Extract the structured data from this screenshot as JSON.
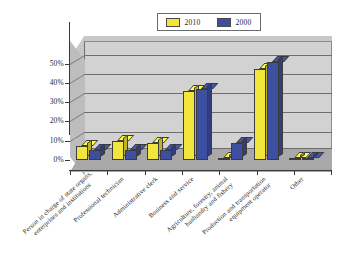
{
  "chart_data": {
    "type": "bar",
    "title": "",
    "subtitle": "",
    "xlabel": "",
    "ylabel": "",
    "ylim": [
      0,
      55
    ],
    "grid": true,
    "legend_position": "top-center",
    "style": "3d-clustered-column",
    "y_ticks": [
      "0%",
      "10%",
      "20%",
      "30%",
      "40%",
      "50%"
    ],
    "y_tick_values": [
      0,
      10,
      20,
      30,
      40,
      50
    ],
    "categories": [
      "Person in charge of state organs,\nenterprises and institutions",
      "Professional technician",
      "Administrative clerk",
      "Business and service",
      "Agriculture, forestry, animal\nhusbandry and fishery",
      "Production and transportation\nequipment operator",
      "Other"
    ],
    "series": [
      {
        "name": "2010",
        "color": "#F2E53C",
        "values": [
          7,
          10,
          9,
          36,
          1,
          47,
          1
        ]
      },
      {
        "name": "2000",
        "color": "#3D4F9E",
        "values": [
          5,
          5,
          5,
          37,
          9,
          51,
          1
        ]
      }
    ]
  },
  "legend": {
    "entries": [
      {
        "label": "2010",
        "color": "#F2E53C"
      },
      {
        "label": "2000",
        "color": "#3D4F9E"
      }
    ]
  },
  "axis": {
    "y_labels": [
      "50%",
      "40%",
      "30%",
      "20%",
      "10%",
      "0%"
    ]
  },
  "colors": {
    "series_2010": "#F2E53C",
    "series_2000": "#3D4F9E",
    "plot_background": "#D2D2D2",
    "floor": "#A8A8A8",
    "gridline": "#6F6F6F",
    "axis": "#3A3A3A",
    "page_background": "#FFFFFF"
  }
}
